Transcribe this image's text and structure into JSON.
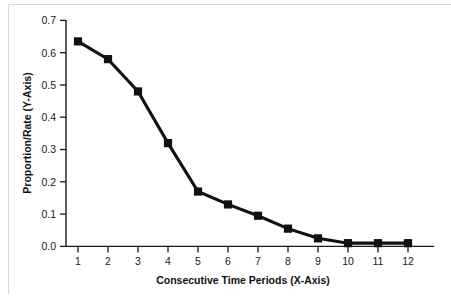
{
  "chart_data": {
    "type": "line",
    "title": "",
    "xlabel": "Consecutive Time Periods (X-Axis)",
    "ylabel": "Proportion/Rate (Y-Axis)",
    "categories": [
      "1",
      "2",
      "3",
      "4",
      "5",
      "6",
      "7",
      "8",
      "9",
      "10",
      "11",
      "12"
    ],
    "x": [
      1,
      2,
      3,
      4,
      5,
      6,
      7,
      8,
      9,
      10,
      11,
      12
    ],
    "values": [
      0.635,
      0.58,
      0.48,
      0.32,
      0.17,
      0.13,
      0.095,
      0.055,
      0.025,
      0.01,
      0.01,
      0.01
    ],
    "series": [
      {
        "name": "Proportion/Rate",
        "values": [
          0.635,
          0.58,
          0.48,
          0.32,
          0.17,
          0.13,
          0.095,
          0.055,
          0.025,
          0.01,
          0.01,
          0.01
        ]
      }
    ],
    "xlim": [
      0.5,
      12.6
    ],
    "ylim": [
      0.0,
      0.7
    ],
    "ytick_labels": [
      "0.0",
      "0.1",
      "0.2",
      "0.3",
      "0.4",
      "0.5",
      "0.6",
      "0.7"
    ],
    "yticks": [
      0.0,
      0.1,
      0.2,
      0.3,
      0.4,
      0.5,
      0.6,
      0.7
    ],
    "xtick_labels": [
      "1",
      "2",
      "3",
      "4",
      "5",
      "6",
      "7",
      "8",
      "9",
      "10",
      "11",
      "12"
    ],
    "grid": false,
    "legend": false,
    "legend_position": "none",
    "marker": "square",
    "line_color": "#111111",
    "marker_color": "#111111",
    "background_color": "#ffffff"
  },
  "figure": {
    "border_color": "#d8d8d8"
  }
}
